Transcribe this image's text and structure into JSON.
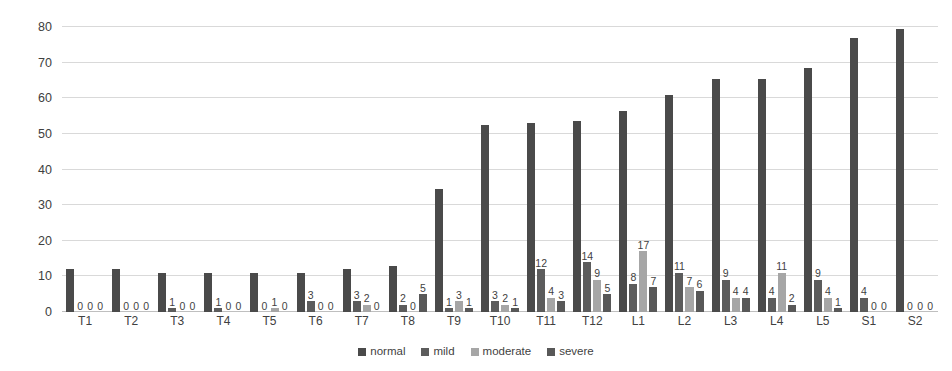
{
  "chart_data": {
    "type": "bar",
    "title": "",
    "subtitle": "",
    "xlabel": "",
    "ylabel": "",
    "ylim": [
      0,
      80
    ],
    "yticks": [
      0,
      10,
      20,
      30,
      40,
      50,
      60,
      70,
      80
    ],
    "grid": true,
    "legend_position": "bottom",
    "show_data_labels": true,
    "categories": [
      "T1",
      "T2",
      "T3",
      "T4",
      "T5",
      "T6",
      "T7",
      "T8",
      "T9",
      "T10",
      "T11",
      "T12",
      "L1",
      "L2",
      "L3",
      "L4",
      "L5",
      "S1",
      "S2"
    ],
    "series": [
      {
        "name": "normal",
        "color": "#4a4a4a",
        "values": [
          12,
          12,
          11,
          11,
          11,
          11,
          12,
          13,
          34.5,
          52.5,
          53,
          53.5,
          56.5,
          61,
          65.5,
          65.5,
          68.5,
          77,
          79.5
        ],
        "labels": [
          "",
          "",
          "",
          "",
          "",
          "",
          "",
          "",
          "",
          "",
          "",
          "",
          "",
          "",
          "",
          "",
          "",
          "",
          ""
        ]
      },
      {
        "name": "mild",
        "color": "#5c5c5c",
        "values": [
          0,
          0,
          1,
          1,
          0,
          3,
          3,
          2,
          1,
          3,
          12,
          14,
          8,
          11,
          9,
          4,
          9,
          4,
          0
        ],
        "labels": [
          "0",
          "0",
          "1",
          "1",
          "0",
          "3",
          "3",
          "2",
          "1",
          "3",
          "12",
          "14",
          "8",
          "11",
          "9",
          "4",
          "9",
          "4",
          "0"
        ]
      },
      {
        "name": "moderate",
        "color": "#a6a6a6",
        "values": [
          0,
          0,
          0,
          0,
          1,
          0,
          2,
          0,
          3,
          2,
          4,
          9,
          17,
          7,
          4,
          11,
          4,
          0,
          0
        ],
        "labels": [
          "0",
          "0",
          "0",
          "0",
          "1",
          "0",
          "2",
          "0",
          "3",
          "2",
          "4",
          "9",
          "17",
          "7",
          "4",
          "11",
          "4",
          "0",
          "0"
        ]
      },
      {
        "name": "severe",
        "color": "#585858",
        "values": [
          0,
          0,
          0,
          0,
          0,
          0,
          0,
          5,
          1,
          1,
          3,
          5,
          7,
          6,
          4,
          2,
          1,
          0,
          0
        ],
        "labels": [
          "0",
          "0",
          "0",
          "0",
          "0",
          "0",
          "0",
          "5",
          "1",
          "1",
          "3",
          "5",
          "7",
          "6",
          "4",
          "2",
          "1",
          "0",
          "0"
        ]
      }
    ]
  },
  "legend": {
    "items": [
      {
        "label": "normal",
        "color": "#4a4a4a"
      },
      {
        "label": "mild",
        "color": "#5c5c5c"
      },
      {
        "label": "moderate",
        "color": "#a6a6a6"
      },
      {
        "label": "severe",
        "color": "#585858"
      }
    ]
  }
}
